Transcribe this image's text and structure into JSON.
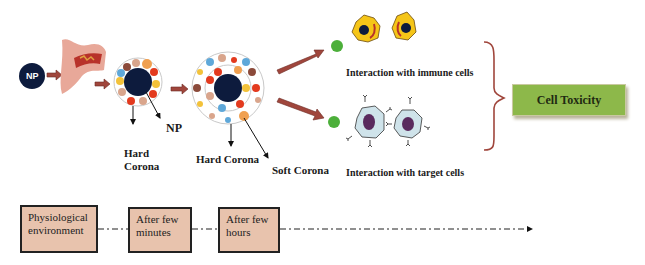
{
  "diagram": {
    "nodes": {
      "np_start": "NP",
      "np_label": "NP",
      "hard_corona_1": [
        "Hard",
        "Corona"
      ],
      "hard_corona_2": "Hard Corona",
      "soft_corona": "Soft Corona",
      "immune_interaction": "Interaction with immune cells",
      "target_interaction": "Interaction with target cells",
      "outcome": "Cell Toxicity"
    },
    "timeline": [
      {
        "line1": "Physiological",
        "line2": "environment"
      },
      {
        "line1": "After few",
        "line2": "minutes"
      },
      {
        "line1": "After  few",
        "line2": "hours"
      }
    ],
    "colors": {
      "np": "#0d1b3d",
      "arrow": "#a0463c",
      "brace": "#a0463c",
      "toxicity_box": "#8db84a",
      "timeline_box": "#e8c3ad",
      "immune_cell": "#f5c518",
      "target_cell": "#cfe3ea",
      "nucleus_target": "#5a2a5e",
      "green_particle": "#4caf3a"
    }
  }
}
